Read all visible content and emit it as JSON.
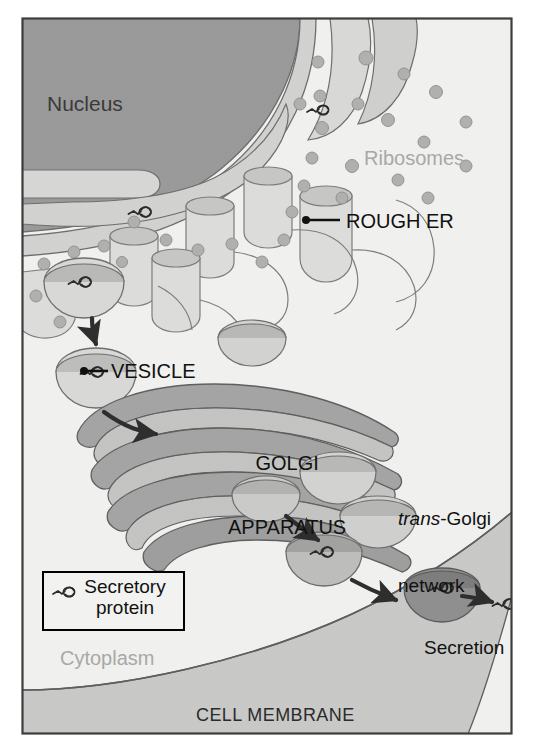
{
  "figure": {
    "style": "grayscale biology textbook illustration"
  },
  "labels": {
    "nucleus": "Nucleus",
    "ribosomes": "Ribosomes",
    "rough_er": "ROUGH ER",
    "vesicle": "VESICLE",
    "golgi_line1": "GOLGI",
    "golgi_line2": "APPARATUS",
    "tgn_italic": "trans",
    "tgn_rest": "-Golgi",
    "tgn_line2": "network",
    "cytoplasm": "Cytoplasm",
    "secretion": "Secretion",
    "cell_membrane": "CELL MEMBRANE"
  },
  "legend": {
    "label_line1": "Secretory",
    "label_line2": "protein",
    "icon": "secretory-protein-icon"
  },
  "colors": {
    "nucleus_fill": "#9a9a9a",
    "cytoplasm_fill": "#f0f0ee",
    "er_fill": "#d2d2d0",
    "er_light": "#dcdcda",
    "golgi_fill": "#a4a4a4",
    "golgi_light": "#c4c4c2",
    "membrane_fill": "#c9c9c7",
    "ribosome_fill": "#b0b0ae",
    "outline": "#6e6e6e",
    "dark_outline": "#4a4a4a",
    "label_black": "#111111",
    "label_gray": "#a8a8a8",
    "frame": "#3d3d3d"
  },
  "structures": [
    {
      "name": "nucleus",
      "description": "large dark gray rounded mass, upper-left"
    },
    {
      "name": "nuclear-envelope",
      "description": "double membrane continuous with rough ER"
    },
    {
      "name": "rough-er",
      "description": "flattened cisternae and tubules studded with ribosomes"
    },
    {
      "name": "ribosomes",
      "description": "small gray dots on ER surface and free in cytoplasm"
    },
    {
      "name": "transport-vesicle",
      "description": "cup-shaped vesicle budding from ER carrying protein"
    },
    {
      "name": "golgi-apparatus",
      "description": "stack of curved flattened cisternae, center"
    },
    {
      "name": "trans-golgi-network",
      "description": "budding vesicles at the trans face, right side"
    },
    {
      "name": "secretory-vesicle",
      "description": "vesicle travelling to the plasma membrane"
    },
    {
      "name": "cell-membrane",
      "description": "curved band across the bottom of the cell"
    },
    {
      "name": "exocytosis",
      "description": "vesicle fusing with membrane, protein released outside"
    }
  ],
  "arrows": [
    {
      "name": "er-to-vesicle",
      "from": "rough ER bud",
      "to": "free vesicle"
    },
    {
      "name": "vesicle-to-golgi",
      "from": "vesicle",
      "to": "cis face of Golgi"
    },
    {
      "name": "golgi-to-secretory-vesicle",
      "from": "trans-Golgi network",
      "to": "secretory vesicle"
    },
    {
      "name": "vesicle-to-membrane",
      "from": "secretory vesicle",
      "to": "cell membrane"
    },
    {
      "name": "release",
      "from": "fusion site",
      "to": "extracellular space"
    }
  ]
}
